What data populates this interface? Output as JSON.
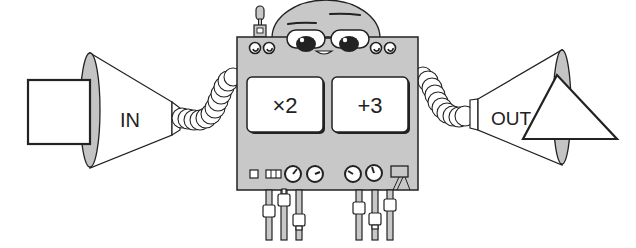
{
  "diagram": {
    "type": "function-machine",
    "input": {
      "label": "IN",
      "shape": "square"
    },
    "output": {
      "label": "OUT",
      "shape": "triangle"
    },
    "operations": [
      {
        "label": "×2"
      },
      {
        "label": "+3"
      }
    ],
    "colors": {
      "stroke": "#222222",
      "body_fill": "#c8c8c8",
      "cone_fill": "#ffffff",
      "cone_rim_fill": "#c4c4c4",
      "panel_fill": "#ffffff",
      "background": "#ffffff"
    }
  }
}
